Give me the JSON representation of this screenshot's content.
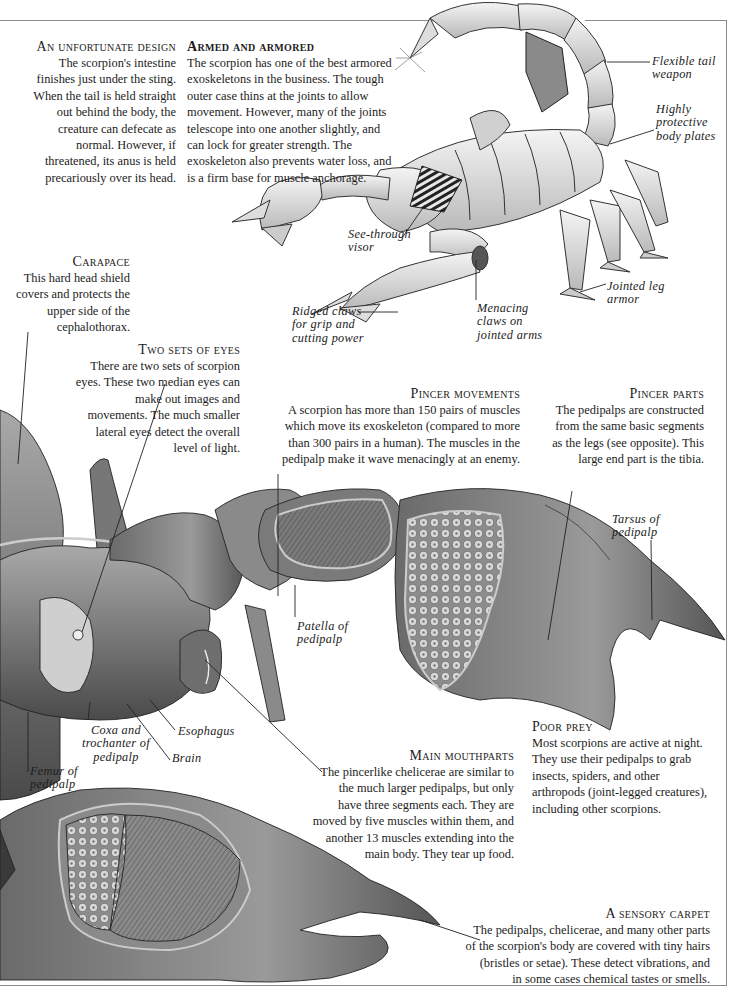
{
  "page": {
    "frame_color": "#8a8a8a",
    "ink_color": "#1c1c1c",
    "background": "#ffffff"
  },
  "sections": {
    "unfortunate_design": {
      "heading": "An unfortunate design",
      "lines": [
        "The scorpion's intestine",
        "finishes just under the sting.",
        "When the tail is held straight",
        "out behind the body, the",
        "creature can defecate as",
        "normal. However, if",
        "threatened, its anus is held",
        "precariously over its head."
      ]
    },
    "armed_and_armored": {
      "heading": "Armed and armored",
      "lines": [
        "The scorpion has one of the best armored",
        "exoskeletons in the business. The tough",
        "outer case thins at the joints to allow",
        "movement. However, many of the joints",
        "telescope into one another slightly, and",
        "can lock for greater strength. The",
        "exoskeleton also prevents water loss, and",
        "is a firm base for muscle anchorage."
      ]
    },
    "carapace": {
      "heading": "Carapace",
      "lines": [
        "This hard head shield",
        "covers and protects the",
        "upper side of the",
        "cephalothorax."
      ]
    },
    "two_sets_of_eyes": {
      "heading": "Two sets of eyes",
      "lines": [
        "There are two sets of scorpion",
        "eyes. These two median eyes can",
        "make out images and",
        "movements. The much smaller",
        "lateral eyes detect the overall",
        "level of light."
      ]
    },
    "pincer_movements": {
      "heading": "Pincer movements",
      "lines": [
        "A scorpion has more than 150 pairs of muscles",
        "which move its exoskeleton (compared to more",
        "than 300 pairs in a human). The muscles in the",
        "pedipalp make it wave menacingly at an enemy."
      ]
    },
    "pincer_parts": {
      "heading": "Pincer parts",
      "lines": [
        "The pedipalps are constructed",
        "from the same basic segments",
        "as the legs (see opposite). This",
        "large end part is the tibia."
      ]
    },
    "poor_prey": {
      "heading": "Poor prey",
      "lines": [
        "Most scorpions are active at night.",
        "They use their pedipalps to grab",
        "insects, spiders, and other",
        "arthropods (joint-legged creatures),",
        "including other scorpions."
      ]
    },
    "main_mouthparts": {
      "heading": "Main mouthparts",
      "lines": [
        "The pincerlike chelicerae are similar to",
        "the much larger pedipalps, but only",
        "have three segments each. They are",
        "moved by five muscles within them, and",
        "another 13 muscles extending  into the",
        "main body. They tear up food."
      ]
    },
    "sensory_carpet": {
      "heading": "A sensory carpet",
      "lines": [
        "The pedipalps, chelicerae, and many other parts",
        "of the scorpion's body are covered with tiny hairs",
        "(bristles or setae). These detect vibrations, and",
        "in some cases chemical tastes or smells."
      ]
    }
  },
  "labels": {
    "flexible_tail": [
      "Flexible tail",
      "weapon"
    ],
    "body_plates": [
      "Highly",
      "protective",
      "body plates"
    ],
    "visor": [
      "See-through",
      "visor"
    ],
    "jointed_leg": [
      "Jointed leg",
      "armor"
    ],
    "ridged_claws": [
      "Ridged claws",
      "for grip and",
      "cutting power"
    ],
    "menacing_claws": [
      "Menacing",
      "claws on",
      "jointed arms"
    ],
    "tarsus": [
      "Tarsus of",
      "pedipalp"
    ],
    "patella": [
      "Patella of",
      "pedipalp"
    ],
    "coxa": [
      "Coxa and",
      "trochanter of",
      "pedipalp"
    ],
    "esophagus": [
      "Esophagus"
    ],
    "brain": [
      "Brain"
    ],
    "femur": [
      "Femur of",
      "pedipalp"
    ]
  },
  "illustrations": {
    "armored_scorpion": "Armored scorpion with see-through visor and shield on tail",
    "cutaway_head": "Cutaway scorpion head and pedipalp showing muscles",
    "cutaway_chela": "Cutaway pedipalp claw showing muscles"
  }
}
